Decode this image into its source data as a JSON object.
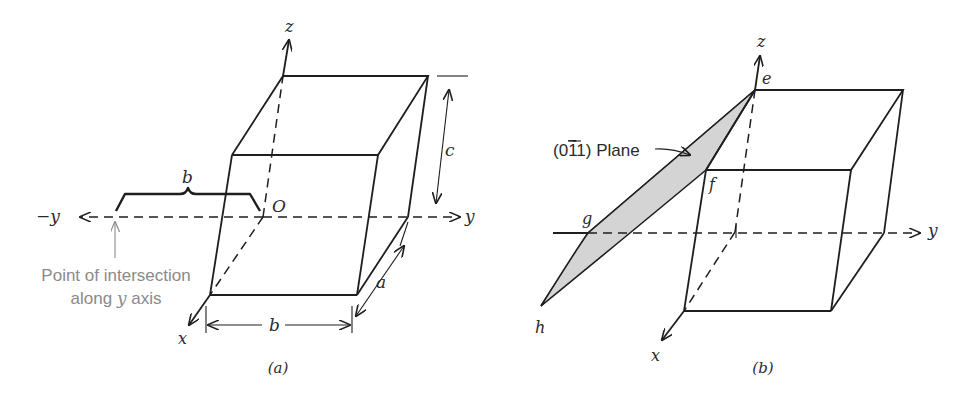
{
  "figure": {
    "panels": [
      {
        "id": "a",
        "caption": "(a)",
        "axes": {
          "z": "z",
          "y_pos": "y",
          "y_neg": "−y",
          "x": "x"
        },
        "origin_label": "O",
        "dimensions": {
          "c": "c",
          "a": "a",
          "b_bottom": "b",
          "b_brace": "b"
        },
        "annotation": {
          "line1": "Point of intersection",
          "line2_prefix": "along ",
          "line2_var": "y",
          "line2_suffix": " axis"
        }
      },
      {
        "id": "b",
        "caption": "(b)",
        "axes": {
          "z": "z",
          "y": "y",
          "x": "x"
        },
        "points": {
          "e": "e",
          "f": "f",
          "g": "g",
          "h": "h"
        },
        "plane_label": "(0̅1) Plane",
        "plane_label_parts": {
          "open": "(0",
          "bar_digit": "1",
          "rest": "1) Plane"
        },
        "plane_fill": "#d4d4d4"
      }
    ]
  }
}
